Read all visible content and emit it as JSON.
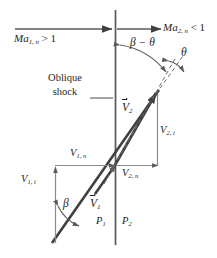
{
  "figure": {
    "colors": {
      "line": "#58595b",
      "heavy_line": "#404042",
      "text": "#231f20",
      "background": "#ffffff"
    }
  },
  "labels": {
    "ma1n": {
      "base": "Ma",
      "sub": "1, n",
      "rel": "> 1"
    },
    "ma2n": {
      "base": "Ma",
      "sub": "2, n",
      "rel": "< 1"
    },
    "beta_minus_theta": "β − θ",
    "theta": "θ",
    "beta": "β",
    "oblique_shock_line1": "Oblique",
    "oblique_shock_line2": "shock",
    "v1_vector": {
      "base": "V",
      "sub": "1"
    },
    "v2_vector": {
      "base": "V",
      "sub": "2"
    },
    "v1n": {
      "base": "V",
      "sub": "1, n"
    },
    "v1t": {
      "base": "V",
      "sub": "1, t"
    },
    "v2n": {
      "base": "V",
      "sub": "2, n"
    },
    "v2t": {
      "base": "V",
      "sub": "2, t"
    },
    "p1": {
      "base": "P",
      "sub": "1"
    },
    "p2": {
      "base": "P",
      "sub": "2"
    }
  },
  "geometry": {
    "shock_line_angle_deg": 55,
    "deflection_angle_deg": 14,
    "shock_origin": [
      115,
      165
    ],
    "vertical_axis_x": 115,
    "upstream_arrow_y": 29
  }
}
